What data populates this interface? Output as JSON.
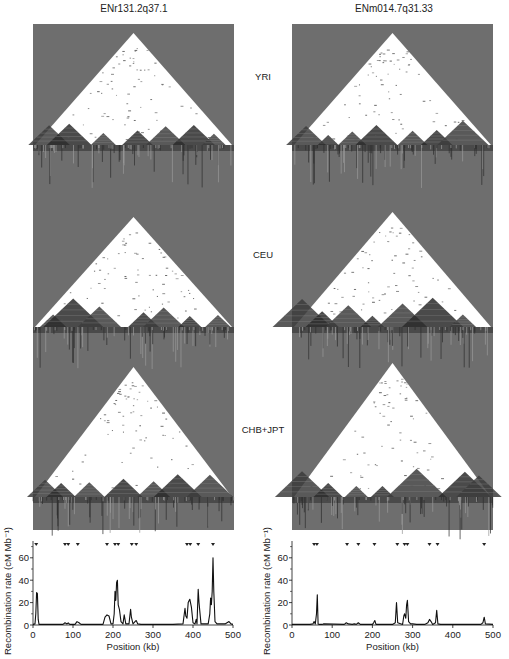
{
  "columns": [
    {
      "title": "ENr131.2q37.1"
    },
    {
      "title": "ENm014.7q31.33"
    }
  ],
  "populations": [
    "YRI",
    "CEU",
    "CHB+JPT"
  ],
  "colors": {
    "panel_gray": "#6e6e6e",
    "ld_white": "#ffffff",
    "ld_dark": "#1e1e1e",
    "line": "#111111"
  },
  "chart_data": [
    {
      "type": "line",
      "title": "ENr131.2q37.1",
      "xlabel": "Position (kb)",
      "ylabel": "Recombination rate (cM Mb⁻¹)",
      "xlim": [
        0,
        500
      ],
      "ylim": [
        0,
        75
      ],
      "x_ticks": [
        0,
        100,
        200,
        300,
        400,
        500
      ],
      "y_ticks": [
        0,
        20,
        40,
        60
      ],
      "grid": false,
      "hotspot_markers_kb": [
        8,
        80,
        88,
        112,
        185,
        205,
        213,
        247,
        258,
        385,
        393,
        413,
        450
      ],
      "x": [
        0,
        5,
        7,
        9,
        11,
        13,
        15,
        60,
        75,
        80,
        85,
        88,
        92,
        105,
        110,
        115,
        120,
        175,
        180,
        185,
        190,
        195,
        200,
        203,
        205,
        207,
        209,
        211,
        213,
        216,
        220,
        225,
        228,
        232,
        240,
        244,
        246,
        250,
        255,
        258,
        262,
        270,
        300,
        350,
        375,
        380,
        382,
        385,
        388,
        392,
        396,
        400,
        405,
        408,
        410,
        413,
        415,
        420,
        438,
        442,
        444,
        446,
        448,
        450,
        452,
        455,
        460,
        480,
        490,
        495,
        500
      ],
      "y": [
        0.5,
        1,
        10,
        29,
        28,
        5,
        0.5,
        0.5,
        0.5,
        2,
        1,
        2,
        0.5,
        0.5,
        3,
        2,
        0.5,
        0.5,
        7,
        9,
        8,
        1,
        1,
        10,
        30,
        22,
        38,
        40,
        18,
        14,
        3,
        1,
        9,
        1,
        1,
        14,
        7,
        1,
        3,
        4,
        1,
        0.5,
        0.5,
        0.5,
        1,
        15,
        8,
        6,
        20,
        23,
        16,
        2,
        1,
        5,
        1,
        32,
        20,
        1,
        1,
        10,
        24,
        18,
        30,
        60,
        30,
        3,
        1,
        1,
        3,
        1,
        0.5
      ]
    },
    {
      "type": "line",
      "title": "ENm014.7q31.33",
      "xlabel": "Position (kb)",
      "ylabel": "Recombination rate (cM Mb⁻¹)",
      "xlim": [
        0,
        500
      ],
      "ylim": [
        0,
        75
      ],
      "x_ticks": [
        0,
        100,
        200,
        300,
        400,
        500
      ],
      "y_ticks": [
        0,
        20,
        40,
        60
      ],
      "grid": false,
      "hotspot_markers_kb": [
        55,
        62,
        137,
        165,
        205,
        262,
        280,
        287,
        342,
        362,
        478
      ],
      "x": [
        0,
        45,
        52,
        55,
        58,
        61,
        63,
        65,
        68,
        75,
        78,
        130,
        135,
        140,
        150,
        155,
        160,
        165,
        170,
        200,
        203,
        206,
        209,
        250,
        257,
        260,
        263,
        275,
        278,
        280,
        283,
        285,
        287,
        290,
        295,
        300,
        310,
        330,
        338,
        342,
        346,
        350,
        357,
        360,
        363,
        370,
        470,
        475,
        478,
        481,
        500
      ],
      "y": [
        0.5,
        0.5,
        1,
        3,
        1,
        10,
        27,
        1,
        0.5,
        0.5,
        1,
        0.5,
        2,
        1,
        0.5,
        1,
        0.5,
        2,
        0.5,
        0.5,
        2,
        4,
        0.5,
        0.5,
        2,
        20,
        2,
        0.5,
        8,
        10,
        6,
        18,
        22,
        3,
        1,
        1,
        0.5,
        0.5,
        2,
        5,
        3,
        0.5,
        2,
        13,
        1,
        0.5,
        0.5,
        2,
        7,
        1,
        0.5
      ]
    }
  ]
}
